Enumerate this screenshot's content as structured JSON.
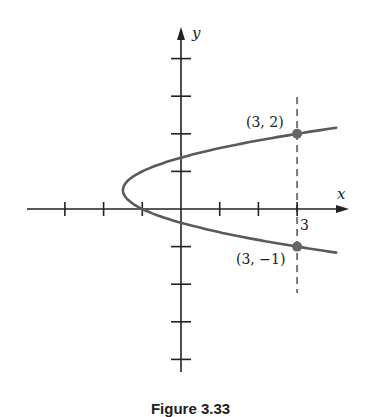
{
  "chart_data": {
    "type": "line",
    "title": "",
    "caption": "Figure 3.33",
    "xlabel": "x",
    "ylabel": "y",
    "xlim": [
      -4,
      4.3
    ],
    "ylim": [
      -4,
      4.3
    ],
    "grid": false,
    "x_ticks": [
      -3,
      -2,
      -1,
      1,
      2,
      3
    ],
    "y_ticks": [
      -4,
      -3,
      -2,
      -1,
      1,
      2,
      3,
      4
    ],
    "x_tick_labels": [
      {
        "x": 3,
        "label": "3"
      }
    ],
    "series": [
      {
        "name": "parabola",
        "equation": "x = 2y^2 - 2y - 1",
        "vertex": [
          -1.5,
          0.5
        ],
        "y_range": [
          -1.16,
          2.16
        ],
        "color": "#5a5a5a"
      }
    ],
    "reference_lines": [
      {
        "type": "vertical",
        "x": 3,
        "style": "dashed",
        "color": "#777777"
      }
    ],
    "points": [
      {
        "x": 3,
        "y": 2,
        "label": "(3, 2)"
      },
      {
        "x": 3,
        "y": -1,
        "label": "(3, −1)"
      }
    ]
  },
  "labels": {
    "x_axis": "x",
    "y_axis": "y",
    "tick_3": "3",
    "point_upper": "(3, 2)",
    "point_lower": "(3, −1)",
    "caption": "Figure 3.33"
  },
  "colors": {
    "axis": "#222222",
    "curve": "#5a5a5a",
    "point": "#666666",
    "dashed": "#777777"
  }
}
